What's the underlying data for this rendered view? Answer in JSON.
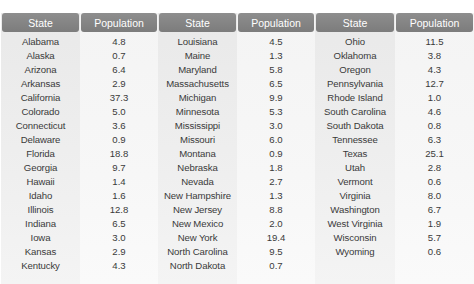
{
  "table": {
    "headers": [
      "State",
      "Population",
      "State",
      "Population",
      "State",
      "Population"
    ],
    "groups": [
      {
        "state_header": "State",
        "population_header": "Population",
        "rows": [
          {
            "state": "Alabama",
            "population": "4.8"
          },
          {
            "state": "Alaska",
            "population": "0.7"
          },
          {
            "state": "Arizona",
            "population": "6.4"
          },
          {
            "state": "Arkansas",
            "population": "2.9"
          },
          {
            "state": "California",
            "population": "37.3"
          },
          {
            "state": "Colorado",
            "population": "5.0"
          },
          {
            "state": "Connecticut",
            "population": "3.6"
          },
          {
            "state": "Delaware",
            "population": "0.9"
          },
          {
            "state": "Florida",
            "population": "18.8"
          },
          {
            "state": "Georgia",
            "population": "9.7"
          },
          {
            "state": "Hawaii",
            "population": "1.4"
          },
          {
            "state": "Idaho",
            "population": "1.6"
          },
          {
            "state": "Illinois",
            "population": "12.8"
          },
          {
            "state": "Indiana",
            "population": "6.5"
          },
          {
            "state": "Iowa",
            "population": "3.0"
          },
          {
            "state": "Kansas",
            "population": "2.9"
          },
          {
            "state": "Kentucky",
            "population": "4.3"
          }
        ]
      },
      {
        "state_header": "State",
        "population_header": "Population",
        "rows": [
          {
            "state": "Louisiana",
            "population": "4.5"
          },
          {
            "state": "Maine",
            "population": "1.3"
          },
          {
            "state": "Maryland",
            "population": "5.8"
          },
          {
            "state": "Massachusetts",
            "population": "6.5"
          },
          {
            "state": "Michigan",
            "population": "9.9"
          },
          {
            "state": "Minnesota",
            "population": "5.3"
          },
          {
            "state": "Mississippi",
            "population": "3.0"
          },
          {
            "state": "Missouri",
            "population": "6.0"
          },
          {
            "state": "Montana",
            "population": "0.9"
          },
          {
            "state": "Nebraska",
            "population": "1.8"
          },
          {
            "state": "Nevada",
            "population": "2.7"
          },
          {
            "state": "New Hampshire",
            "population": "1.3"
          },
          {
            "state": "New Jersey",
            "population": "8.8"
          },
          {
            "state": "New Mexico",
            "population": "2.0"
          },
          {
            "state": "New York",
            "population": "19.4"
          },
          {
            "state": "North Carolina",
            "population": "9.5"
          },
          {
            "state": "North Dakota",
            "population": "0.7"
          }
        ]
      },
      {
        "state_header": "State",
        "population_header": "Population",
        "rows": [
          {
            "state": "Ohio",
            "population": "11.5"
          },
          {
            "state": "Oklahoma",
            "population": "3.8"
          },
          {
            "state": "Oregon",
            "population": "4.3"
          },
          {
            "state": "Pennsylvania",
            "population": "12.7"
          },
          {
            "state": "Rhode Island",
            "population": "1.0"
          },
          {
            "state": "South Carolina",
            "population": "4.6"
          },
          {
            "state": "South Dakota",
            "population": "0.8"
          },
          {
            "state": "Tennessee",
            "population": "6.3"
          },
          {
            "state": "Texas",
            "population": "25.1"
          },
          {
            "state": "Utah",
            "population": "2.8"
          },
          {
            "state": "Vermont",
            "population": "0.6"
          },
          {
            "state": "Virginia",
            "population": "8.0"
          },
          {
            "state": "Washington",
            "population": "6.7"
          },
          {
            "state": "West Virginia",
            "population": "1.9"
          },
          {
            "state": "Wisconsin",
            "population": "5.7"
          },
          {
            "state": "Wyoming",
            "population": "0.6"
          }
        ]
      }
    ]
  },
  "colors": {
    "header_bg": "#858585",
    "header_text": "#ffffff",
    "state_col_bg": "#ececec",
    "population_col_bg": "#f6f6f6",
    "cell_text": "#3a3a3a"
  }
}
